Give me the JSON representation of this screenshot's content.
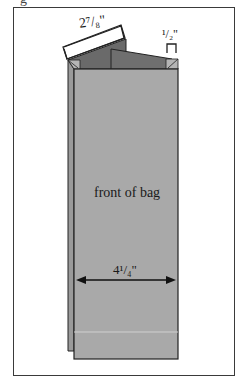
{
  "diagram": {
    "caption_fragment": "g",
    "labels": {
      "top_flap_width": "2⁷/₈\"",
      "gusset_width": "¹/₂\"",
      "front_label": "front of bag",
      "bag_width": "4¹/₄\""
    },
    "colors": {
      "bag_front": "#a9a9a9",
      "bag_back": "#9a9a9a",
      "flap_dark": "#6a6a6a",
      "outline": "#222222",
      "frame": "#3a3a3a"
    }
  }
}
